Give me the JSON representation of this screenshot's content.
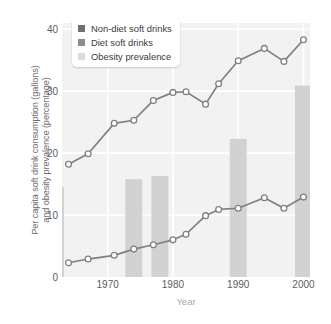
{
  "chart_data": {
    "type": "line",
    "title": "",
    "xlabel": "Year",
    "ylabel": "Per capita soft drink consumption (gallons)\nand obesity prevalence (percentage)",
    "xlim": [
      1963,
      2001
    ],
    "ylim": [
      0,
      41
    ],
    "xticks": [
      1970,
      1980,
      1990,
      2000
    ],
    "yticks": [
      0,
      10,
      20,
      30,
      40
    ],
    "grid": true,
    "legend_position": "top-left",
    "colors": {
      "non_diet_line": "#808080",
      "diet_line": "#808080",
      "marker_fill": "#ffffff",
      "bar_fill": "#d2d2d2",
      "plot_background": "#f2f2f2",
      "gridline": "#ffffff",
      "axis_text": "#5d5d5d",
      "axis_title": "#6d6d6d",
      "xlabel_text": "#a8a8a8"
    },
    "series": [
      {
        "name": "Non-diet soft drinks",
        "type": "line",
        "unit": "gallons per capita",
        "swatch_color": "#707070",
        "x": [
          1964,
          1967,
          1971,
          1974,
          1977,
          1980,
          1982,
          1985,
          1987,
          1990,
          1994,
          1997,
          2000
        ],
        "values": [
          18.2,
          19.9,
          24.8,
          25.3,
          28.5,
          29.8,
          29.9,
          27.9,
          31.2,
          34.9,
          36.9,
          34.8,
          38.3
        ]
      },
      {
        "name": "Diet soft drinks",
        "type": "line",
        "unit": "gallons per capita",
        "swatch_color": "#8c8c8c",
        "x": [
          1964,
          1967,
          1971,
          1974,
          1977,
          1980,
          1982,
          1985,
          1987,
          1990,
          1994,
          1997,
          2000
        ],
        "values": [
          2.3,
          2.9,
          3.5,
          4.5,
          5.2,
          6.0,
          6.9,
          9.9,
          10.9,
          11.1,
          12.8,
          11.1,
          12.9
        ]
      },
      {
        "name": "Obesity prevalence",
        "type": "bar",
        "unit": "percentage",
        "swatch_color": "#dcdcdc",
        "x": [
          1962,
          1974,
          1978,
          1990,
          2000
        ],
        "values": [
          14.5,
          15.8,
          16.3,
          22.3,
          30.9
        ]
      }
    ]
  },
  "legend": {
    "items": [
      {
        "label": "Non-diet soft drinks",
        "color": "#707070"
      },
      {
        "label": "Diet soft drinks",
        "color": "#8c8c8c"
      },
      {
        "label": "Obesity prevalence",
        "color": "#dcdcdc"
      }
    ]
  },
  "axes": {
    "y_title": "Per capita soft drink consumption (gallons)\nand obesity prevalence (percentage)",
    "x_title": "Year",
    "y_tick_labels": [
      "40",
      "30",
      "20",
      "10",
      "0"
    ],
    "x_tick_labels": [
      "1970",
      "1980",
      "1990",
      "2000"
    ]
  }
}
